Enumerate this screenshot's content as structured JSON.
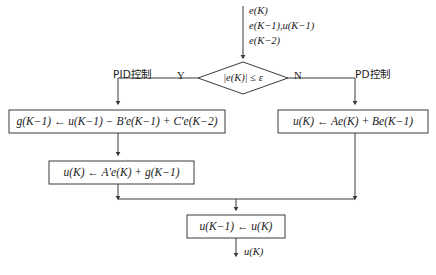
{
  "diagram": {
    "type": "flowchart",
    "background_color": "#ffffff",
    "line_color": "#3a3a3a",
    "text_color": "#1a1a1a",
    "input_stack": {
      "line1": "e(K)",
      "line2": "e(K−1),u(K−1)",
      "line3": "e(K−2)"
    },
    "decision": {
      "name": "error-threshold-decision",
      "text": "|e(K)| ≤ ε",
      "yes_label": "Y",
      "no_label": "N",
      "yes_branch_caption": "PID控制",
      "no_branch_caption": "PD控制"
    },
    "nodes": [
      {
        "id": "pid-g-update",
        "text": "g(K−1) ← u(K−1) − B′e(K−1) + C′e(K−2)"
      },
      {
        "id": "pid-u-update",
        "text": "u(K) ← A′e(K) + g(K−1)"
      },
      {
        "id": "pd-u-update",
        "text": "u(K) ← Ae(K) + Be(K−1)"
      },
      {
        "id": "shift-u",
        "text": "u(K−1) ← u(K)"
      }
    ],
    "output_label": "u(K)"
  }
}
